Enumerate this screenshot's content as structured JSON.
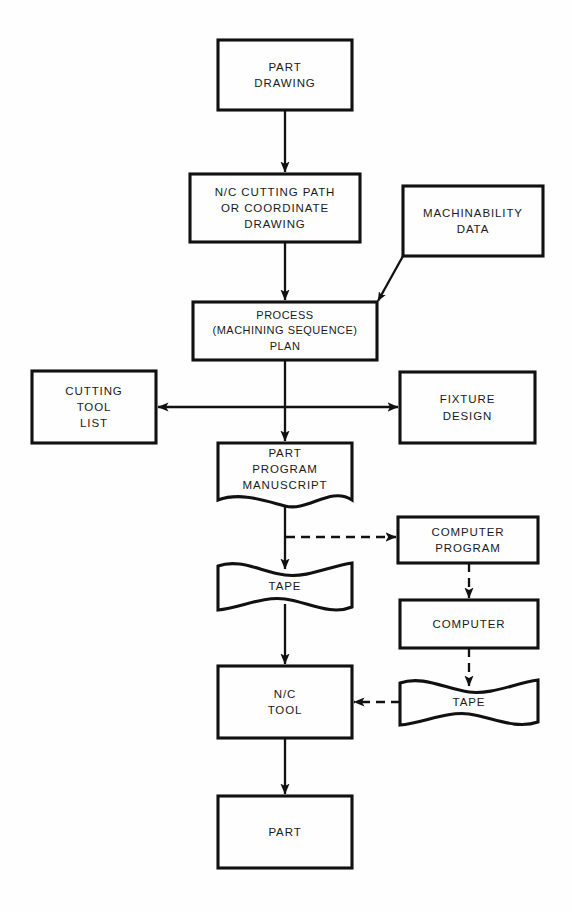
{
  "diagram": {
    "background_color": "#fefefe",
    "line_color": "#111111",
    "text_color": "#1a1a1a",
    "nodes": [
      {
        "id": "part-drawing",
        "label": "PART\nDRAWING",
        "shape": "rect",
        "x": 218,
        "y": 40,
        "w": 134,
        "h": 70
      },
      {
        "id": "nc-cutting-path",
        "label": "N/C CUTTING PATH\nOR COORDINATE\nDRAWING",
        "shape": "rect",
        "x": 190,
        "y": 174,
        "w": 170,
        "h": 68
      },
      {
        "id": "machinability-data",
        "label": "MACHINABILITY\nDATA",
        "shape": "rect",
        "x": 403,
        "y": 186,
        "w": 140,
        "h": 70
      },
      {
        "id": "process-plan",
        "label": "PROCESS\n(MACHINING SEQUENCE)\nPLAN",
        "shape": "rect",
        "x": 193,
        "y": 302,
        "w": 184,
        "h": 58
      },
      {
        "id": "cutting-tool-list",
        "label": "CUTTING\nTOOL\nLIST",
        "shape": "rect",
        "x": 32,
        "y": 371,
        "w": 124,
        "h": 72
      },
      {
        "id": "fixture-design",
        "label": "FIXTURE\nDESIGN",
        "shape": "rect",
        "x": 400,
        "y": 372,
        "w": 135,
        "h": 71
      },
      {
        "id": "part-program-manuscript",
        "label": "PART\nPROGRAM\nMANUSCRIPT",
        "shape": "tape",
        "x": 218,
        "y": 443,
        "w": 134,
        "h": 57
      },
      {
        "id": "computer-program",
        "label": "COMPUTER\nPROGRAM",
        "shape": "rect",
        "x": 398,
        "y": 517,
        "w": 140,
        "h": 46
      },
      {
        "id": "tape-manual",
        "label": "TAPE",
        "shape": "tape",
        "x": 218,
        "y": 563,
        "w": 134,
        "h": 47
      },
      {
        "id": "computer",
        "label": "COMPUTER",
        "shape": "rect",
        "x": 400,
        "y": 600,
        "w": 138,
        "h": 48
      },
      {
        "id": "nc-tool",
        "label": "N/C\nTOOL",
        "shape": "rect",
        "x": 218,
        "y": 666,
        "w": 134,
        "h": 72
      },
      {
        "id": "tape-computed",
        "label": "TAPE",
        "shape": "tape",
        "x": 400,
        "y": 680,
        "w": 138,
        "h": 45
      },
      {
        "id": "part",
        "label": "PART",
        "shape": "rect",
        "x": 218,
        "y": 796,
        "w": 134,
        "h": 72
      }
    ],
    "connectors": [
      {
        "id": "part-drawing-to-nc-cutting-path",
        "style": "solid",
        "arrow": "end"
      },
      {
        "id": "nc-cutting-path-to-process-plan",
        "style": "solid",
        "arrow": "end"
      },
      {
        "id": "machinability-data-to-process-plan",
        "style": "solid",
        "arrow": "end"
      },
      {
        "id": "process-plan-to-cutting-tool-list",
        "style": "solid",
        "arrow": "end"
      },
      {
        "id": "process-plan-to-fixture-design",
        "style": "solid",
        "arrow": "end"
      },
      {
        "id": "process-plan-to-part-program-manuscript",
        "style": "solid",
        "arrow": "end"
      },
      {
        "id": "part-program-manuscript-to-tape-manual",
        "style": "solid",
        "arrow": "end"
      },
      {
        "id": "part-program-manuscript-to-computer-program",
        "style": "dashed",
        "arrow": "end"
      },
      {
        "id": "computer-program-to-computer",
        "style": "dashed",
        "arrow": "end"
      },
      {
        "id": "computer-to-tape-computed",
        "style": "dashed",
        "arrow": "end"
      },
      {
        "id": "tape-manual-to-nc-tool",
        "style": "solid",
        "arrow": "end"
      },
      {
        "id": "tape-computed-to-nc-tool",
        "style": "dashed",
        "arrow": "end"
      },
      {
        "id": "nc-tool-to-part",
        "style": "solid",
        "arrow": "end"
      }
    ]
  }
}
